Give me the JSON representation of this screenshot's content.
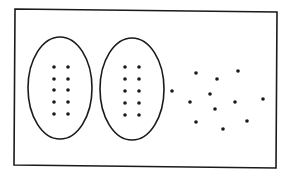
{
  "diagram": {
    "colors": {
      "background": "#ffffff",
      "stroke": "#1a1a1a",
      "dot": "#1a1a1a"
    },
    "frame": {
      "points": "15,9 277,12 276,168 14,165"
    },
    "ellipses": [
      {
        "id": "group-1",
        "cx": 60,
        "cy": 88,
        "rx": 32,
        "ry": 51,
        "dot_count": 10
      },
      {
        "id": "group-2",
        "cx": 132,
        "cy": 89,
        "rx": 32,
        "ry": 51,
        "dot_count": 10
      }
    ],
    "grouped_dots": [
      {
        "group": "group-1",
        "x": 54,
        "y": 67
      },
      {
        "group": "group-1",
        "x": 68,
        "y": 67
      },
      {
        "group": "group-1",
        "x": 54,
        "y": 79
      },
      {
        "group": "group-1",
        "x": 68,
        "y": 79
      },
      {
        "group": "group-1",
        "x": 54,
        "y": 90
      },
      {
        "group": "group-1",
        "x": 68,
        "y": 90
      },
      {
        "group": "group-1",
        "x": 54,
        "y": 102
      },
      {
        "group": "group-1",
        "x": 68,
        "y": 102
      },
      {
        "group": "group-1",
        "x": 54,
        "y": 114
      },
      {
        "group": "group-1",
        "x": 68,
        "y": 114
      },
      {
        "group": "group-2",
        "x": 125,
        "y": 67
      },
      {
        "group": "group-2",
        "x": 139,
        "y": 67
      },
      {
        "group": "group-2",
        "x": 125,
        "y": 79
      },
      {
        "group": "group-2",
        "x": 139,
        "y": 79
      },
      {
        "group": "group-2",
        "x": 125,
        "y": 91
      },
      {
        "group": "group-2",
        "x": 139,
        "y": 91
      },
      {
        "group": "group-2",
        "x": 125,
        "y": 103
      },
      {
        "group": "group-2",
        "x": 139,
        "y": 103
      },
      {
        "group": "group-2",
        "x": 125,
        "y": 115
      },
      {
        "group": "group-2",
        "x": 139,
        "y": 115
      }
    ],
    "loose_dots": [
      {
        "x": 172,
        "y": 91
      },
      {
        "x": 196,
        "y": 73
      },
      {
        "x": 217,
        "y": 79
      },
      {
        "x": 238,
        "y": 71
      },
      {
        "x": 190,
        "y": 102
      },
      {
        "x": 210,
        "y": 94
      },
      {
        "x": 235,
        "y": 102
      },
      {
        "x": 263,
        "y": 99
      },
      {
        "x": 215,
        "y": 109
      },
      {
        "x": 196,
        "y": 122
      },
      {
        "x": 247,
        "y": 121
      },
      {
        "x": 223,
        "y": 129
      }
    ],
    "dot_radius": 1.8
  }
}
